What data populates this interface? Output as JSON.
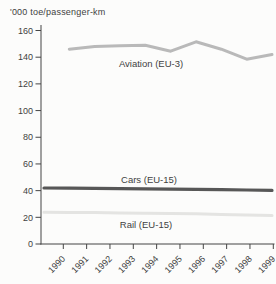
{
  "chart_data": {
    "type": "line",
    "title": "'000 toe/passenger-km",
    "xlabel": "",
    "ylabel": "'000 toe/passenger-km",
    "x_categories": [
      "1990",
      "1991",
      "1992",
      "1993",
      "1994",
      "1995",
      "1996",
      "1997",
      "1998",
      "1999"
    ],
    "ylim": [
      0,
      160
    ],
    "yticks": [
      0,
      20,
      40,
      60,
      80,
      100,
      120,
      140,
      160
    ],
    "grid": false,
    "legend_position": "inline-labels",
    "series": [
      {
        "name": "Rail (EU-15)",
        "start_year": "1990",
        "start_index": 0,
        "values": [
          23.8,
          23.7,
          23.5,
          23.3,
          23.1,
          22.9,
          22.6,
          22.2,
          21.8,
          21.3
        ],
        "color": "#e4e4e2",
        "width": 3,
        "label": {
          "x": 146,
          "y": 228
        }
      },
      {
        "name": "Cars (EU-15)",
        "start_year": "1990",
        "start_index": 0,
        "values": [
          42,
          41.9,
          41.7,
          41.5,
          41.3,
          41.1,
          41,
          40.8,
          40.5,
          40.2
        ],
        "color": "#575757",
        "width": 3.2,
        "label": {
          "x": 149,
          "y": 183
        }
      },
      {
        "name": "Aviation (EU-3)",
        "start_year": "1991",
        "start_index": 1,
        "values": [
          146,
          148,
          148.5,
          149,
          144.5,
          151.5,
          146,
          138.5,
          142
        ],
        "color": "#b9b9b9",
        "width": 3,
        "label": {
          "x": 151,
          "y": 67
        }
      }
    ],
    "axis_color": "#454545",
    "text_color": "#3f3f3f",
    "background_color": "#fcfcfb"
  }
}
